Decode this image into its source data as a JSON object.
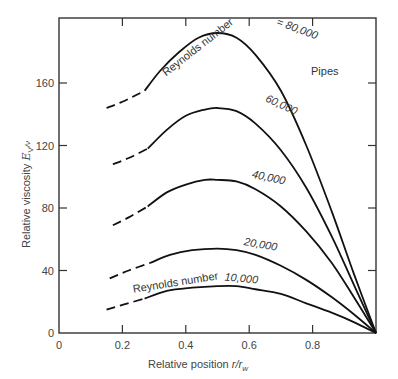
{
  "chart_data": {
    "type": "line",
    "title": "",
    "xlabel": "Relative position r/r_w",
    "xlabel_main": "Relative position ",
    "xlabel_var": "r/r",
    "xlabel_sub": "w",
    "ylabel": "Relative viscosity E_V/ν",
    "ylabel_main": "Relative viscosity ",
    "ylabel_var": "E",
    "ylabel_sub": "V",
    "ylabel_tail": "/ν",
    "xlim": [
      0,
      1.0
    ],
    "ylim": [
      0,
      200
    ],
    "xticks": [
      0,
      0.2,
      0.4,
      0.6,
      0.8
    ],
    "xtick_labels": [
      "0",
      "0.2",
      "0.4",
      "0.6",
      "0.8"
    ],
    "yticks": [
      0,
      40,
      80,
      120,
      160
    ],
    "ytick_labels": [
      "0",
      "40",
      "80",
      "120",
      "160"
    ],
    "grid": false,
    "annotation": "Pipes",
    "series_prefix_label": "Reynolds number",
    "series_prefix_label_top": "Reynolds number = 80,000",
    "series": [
      {
        "name": "80,000",
        "label": "80,000",
        "dashed": [
          [
            0.15,
            144
          ],
          [
            0.2,
            148
          ],
          [
            0.27,
            155
          ]
        ],
        "solid": [
          [
            0.27,
            155
          ],
          [
            0.32,
            168
          ],
          [
            0.38,
            180
          ],
          [
            0.44,
            189
          ],
          [
            0.5,
            192
          ],
          [
            0.56,
            189
          ],
          [
            0.62,
            178
          ],
          [
            0.7,
            155
          ],
          [
            0.78,
            120
          ],
          [
            0.86,
            78
          ],
          [
            0.93,
            38
          ],
          [
            1.0,
            0
          ]
        ]
      },
      {
        "name": "60,000",
        "label": "60,000",
        "dashed": [
          [
            0.17,
            108
          ],
          [
            0.22,
            112
          ],
          [
            0.28,
            118
          ]
        ],
        "solid": [
          [
            0.28,
            118
          ],
          [
            0.34,
            130
          ],
          [
            0.4,
            139
          ],
          [
            0.46,
            143
          ],
          [
            0.5,
            144
          ],
          [
            0.56,
            142
          ],
          [
            0.62,
            134
          ],
          [
            0.7,
            117
          ],
          [
            0.78,
            93
          ],
          [
            0.86,
            62
          ],
          [
            0.93,
            31
          ],
          [
            1.0,
            0
          ]
        ]
      },
      {
        "name": "40,000",
        "label": "40,000",
        "dashed": [
          [
            0.17,
            69
          ],
          [
            0.22,
            74
          ],
          [
            0.28,
            81
          ]
        ],
        "solid": [
          [
            0.28,
            81
          ],
          [
            0.34,
            90
          ],
          [
            0.4,
            95
          ],
          [
            0.46,
            98
          ],
          [
            0.5,
            98
          ],
          [
            0.56,
            97
          ],
          [
            0.62,
            92
          ],
          [
            0.7,
            81
          ],
          [
            0.78,
            65
          ],
          [
            0.86,
            45
          ],
          [
            0.93,
            23
          ],
          [
            1.0,
            0
          ]
        ]
      },
      {
        "name": "20,000",
        "label": "20,000",
        "dashed": [
          [
            0.16,
            35
          ],
          [
            0.22,
            40
          ],
          [
            0.29,
            45
          ]
        ],
        "solid": [
          [
            0.29,
            45
          ],
          [
            0.35,
            50
          ],
          [
            0.42,
            53
          ],
          [
            0.5,
            54
          ],
          [
            0.56,
            53
          ],
          [
            0.62,
            50
          ],
          [
            0.7,
            43
          ],
          [
            0.78,
            34
          ],
          [
            0.86,
            23
          ],
          [
            0.93,
            12
          ],
          [
            1.0,
            0
          ]
        ]
      },
      {
        "name": "10,000",
        "label": "10,000",
        "dashed": [
          [
            0.15,
            15
          ],
          [
            0.2,
            18
          ],
          [
            0.27,
            22
          ]
        ],
        "solid": [
          [
            0.27,
            22
          ],
          [
            0.34,
            27
          ],
          [
            0.42,
            29
          ],
          [
            0.5,
            30
          ],
          [
            0.56,
            30
          ],
          [
            0.62,
            28
          ],
          [
            0.7,
            25
          ],
          [
            0.78,
            19
          ],
          [
            0.86,
            13
          ],
          [
            0.93,
            7
          ],
          [
            1.0,
            0
          ]
        ]
      }
    ]
  }
}
